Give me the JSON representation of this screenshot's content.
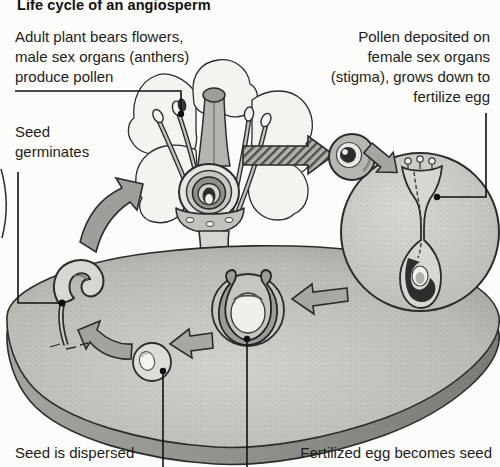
{
  "title": "Life cycle of an angiosperm",
  "labels": {
    "adult_plant": [
      "Adult plant bears flowers,",
      "male sex organs (anthers)",
      "produce pollen"
    ],
    "pollen_deposited": [
      "Pollen deposited on",
      "female sex organs",
      "(stigma), grows down to",
      "fertilize egg"
    ],
    "seed_germinates": [
      "Seed",
      "germinates"
    ],
    "seed_dispersed": "Seed is dispersed",
    "fertilized_egg": "Fertilized egg becomes seed"
  },
  "colors": {
    "paper": "#fcfcfa",
    "ink": "#222222",
    "disc_surface": "#c0c0bb",
    "disc_side": "#8d8d88",
    "arrow_fill": "#a8a8a3",
    "detail_circle_fill": "#cbcbc6",
    "petal_fill": "#f3f3f0"
  }
}
